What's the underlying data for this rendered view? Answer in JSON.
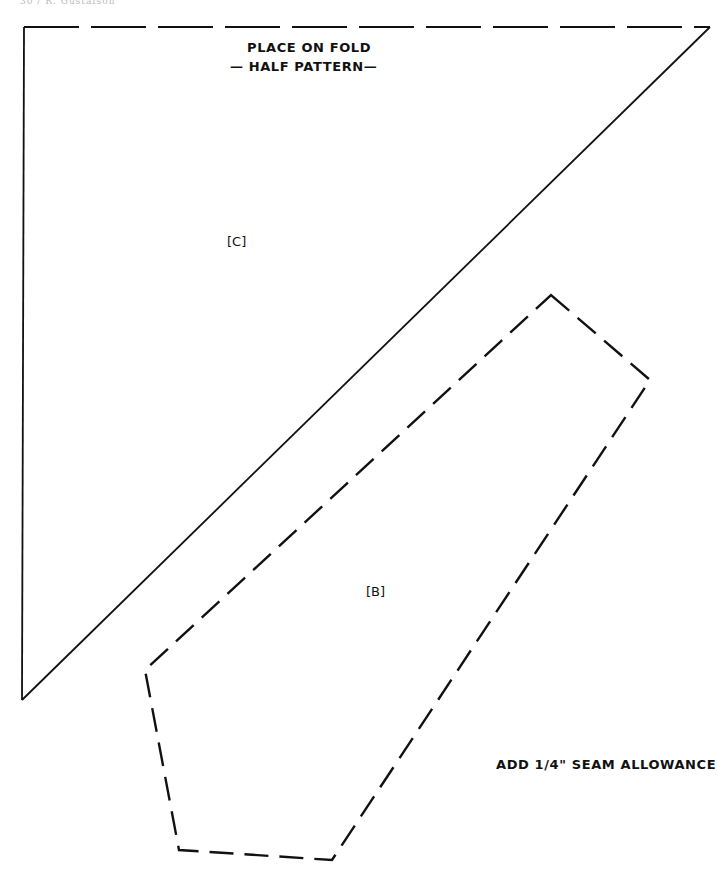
{
  "page_header": "30 / R. Gustafson",
  "fold_note": {
    "line1": "PLACE ON FOLD",
    "line2": "— HALF PATTERN—"
  },
  "pieces": {
    "c": "[C]",
    "b": "[B]"
  },
  "seam_note": "ADD 1/4\" SEAM ALLOWANCE",
  "colors": {
    "ink": "#111111",
    "paper": "#ffffff"
  }
}
